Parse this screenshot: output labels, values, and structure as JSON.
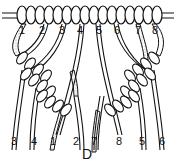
{
  "figure": {
    "caption": "D",
    "top_labels": [
      "1",
      "2",
      "3",
      "4",
      "5",
      "6",
      "7",
      "8"
    ],
    "bottom_labels": [
      "3",
      "4",
      "1",
      "2",
      "7",
      "8",
      "5",
      "6"
    ]
  },
  "colors": {
    "ink": "#111111",
    "paper": "#ffffff",
    "stipple": "#888888"
  }
}
